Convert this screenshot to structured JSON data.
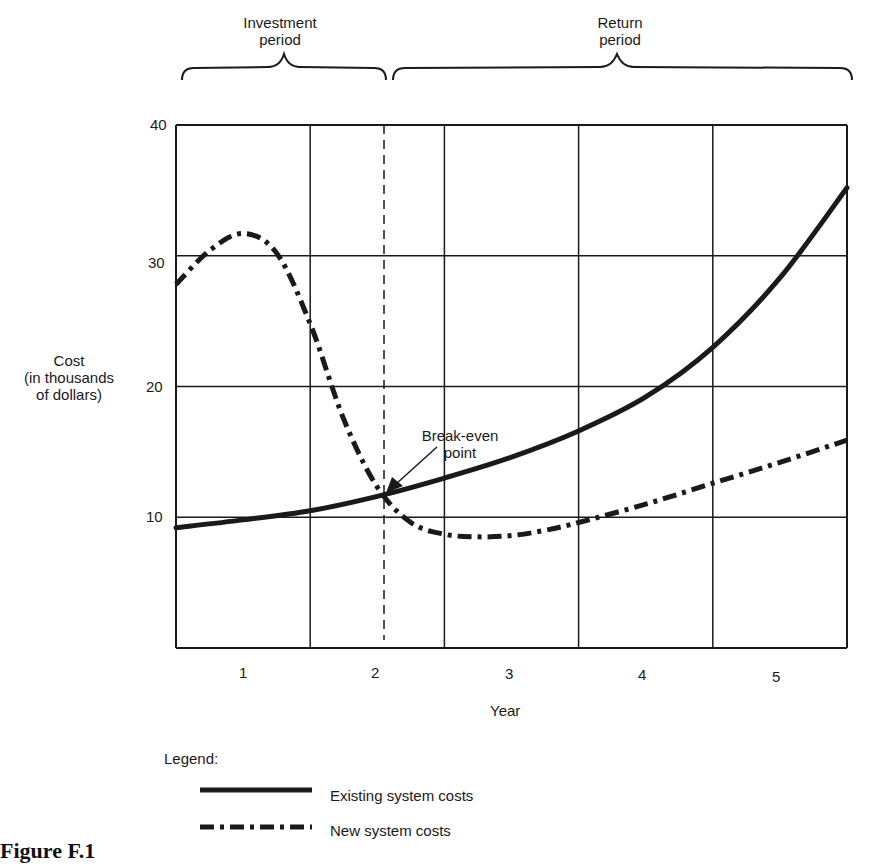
{
  "chart_data": {
    "type": "line",
    "title": "",
    "xlabel": "Year",
    "ylabel": "Cost (in thousands of dollars)",
    "ylabel_lines": [
      "Cost",
      "(in thousands",
      "of dollars)"
    ],
    "x_ticks": [
      "1",
      "2",
      "3",
      "4",
      "5"
    ],
    "y_ticks": [
      "10",
      "20",
      "30",
      "40"
    ],
    "xlim": [
      0.5,
      5.5
    ],
    "ylim": [
      0,
      40
    ],
    "grid": true,
    "series": [
      {
        "name": "Existing system costs",
        "style": "solid",
        "x": [
          0.5,
          1.0,
          1.5,
          2.0,
          2.5,
          3.0,
          3.5,
          4.0,
          4.5,
          5.0,
          5.5
        ],
        "values": [
          9.2,
          9.8,
          10.5,
          11.6,
          13.0,
          14.6,
          16.6,
          19.2,
          23.0,
          28.3,
          35.2
        ]
      },
      {
        "name": "New system costs",
        "style": "dash-dot",
        "x": [
          0.5,
          0.75,
          1.0,
          1.25,
          1.5,
          1.75,
          2.0,
          2.25,
          2.5,
          2.75,
          3.0,
          3.25,
          3.5,
          4.0,
          4.5,
          5.0,
          5.5
        ],
        "values": [
          27.8,
          30.4,
          31.7,
          30.2,
          24.8,
          17.5,
          12.3,
          9.6,
          8.7,
          8.5,
          8.6,
          9.0,
          9.6,
          11.0,
          12.6,
          14.2,
          15.9
        ]
      }
    ],
    "annotations": [
      {
        "text": "Break-even point",
        "x": 2.05,
        "y": 12.0
      },
      {
        "text": "Investment period",
        "x_range": [
          0.5,
          2.05
        ]
      },
      {
        "text": "Return period",
        "x_range": [
          2.1,
          5.5
        ]
      }
    ],
    "vertical_marker": {
      "x": 2.05,
      "style": "dashed"
    },
    "legend_position": "bottom-left"
  },
  "labels": {
    "investment_period": [
      "Investment",
      "period"
    ],
    "return_period": [
      "Return",
      "period"
    ],
    "break_even": [
      "Break-even",
      "point"
    ],
    "legend_title": "Legend:",
    "legend_existing": "Existing system costs",
    "legend_new": "New system costs",
    "caption": "Figure F.1"
  }
}
